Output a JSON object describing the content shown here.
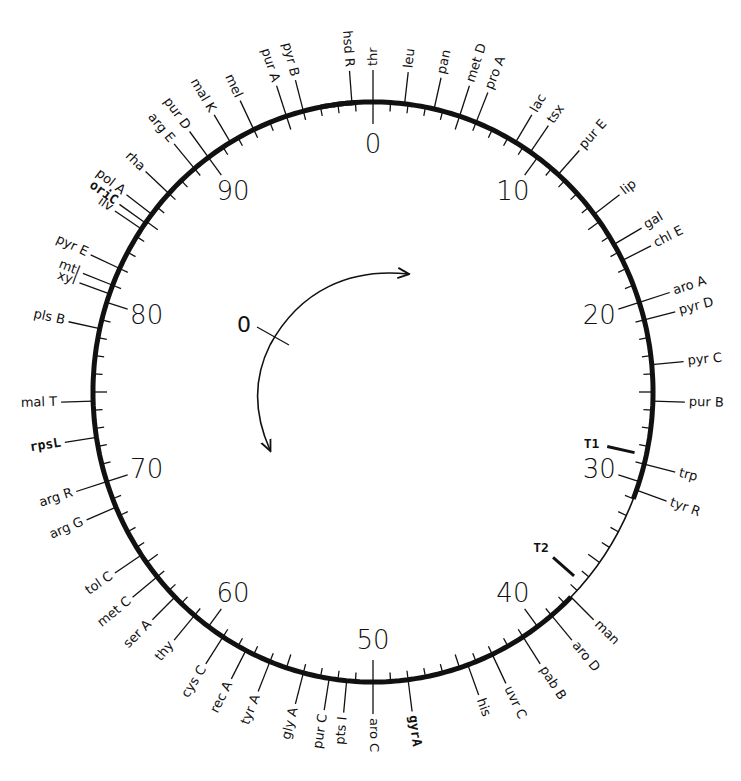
{
  "geometry": {
    "cx": 373,
    "cy": 392,
    "rx": 280,
    "ry": 290
  },
  "minute_labels": [
    {
      "label": "0",
      "min": 0
    },
    {
      "label": "10",
      "min": 10
    },
    {
      "label": "20",
      "min": 20
    },
    {
      "label": "30",
      "min": 30
    },
    {
      "label": "40",
      "min": 40
    },
    {
      "label": "50",
      "min": 50
    },
    {
      "label": "60",
      "min": 60
    },
    {
      "label": "70",
      "min": 70
    },
    {
      "label": "80",
      "min": 80
    },
    {
      "label": "90",
      "min": 90
    }
  ],
  "thick_segments": [
    [
      -3,
      31
    ],
    [
      37.5,
      99
    ]
  ],
  "genes": [
    {
      "name": "hsd R",
      "min": 98.8
    },
    {
      "name": "thr",
      "min": 0
    },
    {
      "name": "leu",
      "min": 1.8
    },
    {
      "name": "pan",
      "min": 3.5
    },
    {
      "name": "met D",
      "min": 5
    },
    {
      "name": "pro A",
      "min": 6
    },
    {
      "name": "lac",
      "min": 8.5
    },
    {
      "name": "tsx",
      "min": 9.5
    },
    {
      "name": "pur E",
      "min": 11.5
    },
    {
      "name": "lip",
      "min": 14.5
    },
    {
      "name": "gal",
      "min": 16.5
    },
    {
      "name": "chl E",
      "min": 17.5
    },
    {
      "name": "aro A",
      "min": 20
    },
    {
      "name": "pyr D",
      "min": 21
    },
    {
      "name": "pyr C",
      "min": 23.5
    },
    {
      "name": "pur B",
      "min": 25.5
    },
    {
      "name": "trp",
      "min": 29
    },
    {
      "name": "tyr R",
      "min": 30.5
    },
    {
      "name": "man",
      "min": 37.5
    },
    {
      "name": "aro D",
      "min": 39
    },
    {
      "name": "pab B",
      "min": 41
    },
    {
      "name": "uvr C",
      "min": 43
    },
    {
      "name": "his",
      "min": 44.5
    },
    {
      "name": "gyrA",
      "min": 48,
      "mono": true
    },
    {
      "name": "aro C",
      "min": 50
    },
    {
      "name": "pts I",
      "min": 51.5
    },
    {
      "name": "pur C",
      "min": 52.5
    },
    {
      "name": "gly A",
      "min": 54
    },
    {
      "name": "tyr A",
      "min": 56
    },
    {
      "name": "rec A",
      "min": 57.5
    },
    {
      "name": "cys C",
      "min": 59
    },
    {
      "name": "thy",
      "min": 61
    },
    {
      "name": "ser A",
      "min": 62.5
    },
    {
      "name": "met C",
      "min": 64
    },
    {
      "name": "tol C",
      "min": 65.5
    },
    {
      "name": "arg G",
      "min": 68.5
    },
    {
      "name": "arg R",
      "min": 70
    },
    {
      "name": "rpsL",
      "min": 72.5,
      "mono": true
    },
    {
      "name": "mal T",
      "min": 74.5
    },
    {
      "name": "pls B",
      "min": 78.5
    },
    {
      "name": "xyl",
      "min": 80.5
    },
    {
      "name": "mtl",
      "min": 81
    },
    {
      "name": "pyr E",
      "min": 82
    },
    {
      "name": "ilv",
      "min": 84.5
    },
    {
      "name": "oriC",
      "min": 84.9,
      "mono": true
    },
    {
      "name": "pol A",
      "min": 85.5
    },
    {
      "name": "rha",
      "min": 87
    },
    {
      "name": "arg E",
      "min": 89
    },
    {
      "name": "pur D",
      "min": 90
    },
    {
      "name": "mal K",
      "min": 91.5
    },
    {
      "name": "mel",
      "min": 93
    },
    {
      "name": "pur A",
      "min": 95
    },
    {
      "name": "pyr B",
      "min": 96
    }
  ],
  "terminators": [
    {
      "label": "T1",
      "min": 28.5
    },
    {
      "label": "T2",
      "min": 36.5
    }
  ],
  "origin_marker": {
    "label": "0"
  }
}
